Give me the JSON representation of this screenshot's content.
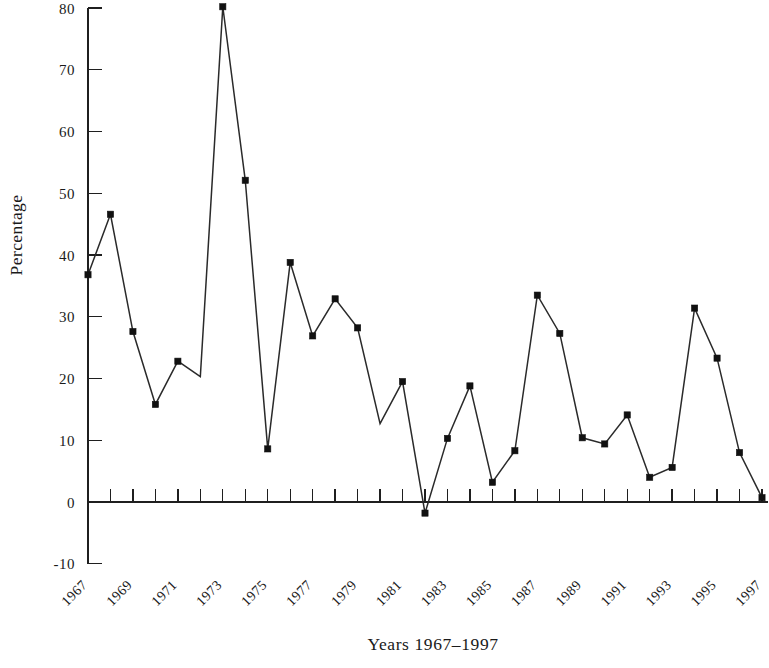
{
  "chart_data": {
    "type": "line",
    "title": "",
    "subtitle": "",
    "xlabel": "Years 1967–1997",
    "ylabel": "Percentage",
    "grid": false,
    "legend": "none",
    "xlim": [
      1967,
      1997
    ],
    "ylim": [
      -10,
      80
    ],
    "ytick_values": [
      80,
      70,
      60,
      50,
      40,
      30,
      20,
      10,
      0,
      -10
    ],
    "ytick_labels": [
      "80",
      "70",
      "60",
      "50",
      "40",
      "30",
      "20",
      "10",
      "0",
      "-10"
    ],
    "xtick_values": [
      1967,
      1969,
      1971,
      1973,
      1975,
      1977,
      1979,
      1981,
      1983,
      1985,
      1987,
      1989,
      1991,
      1993,
      1995,
      1997
    ],
    "xtick_labels": [
      "1967",
      "1969",
      "1971",
      "1973",
      "1975",
      "1977",
      "1979",
      "1981",
      "1983",
      "1985",
      "1987",
      "1989",
      "1991",
      "1993",
      "1995",
      "1997"
    ],
    "xtick_rotation_deg": 45,
    "x": [
      1967,
      1968,
      1969,
      1970,
      1971,
      1972,
      1973,
      1974,
      1975,
      1976,
      1977,
      1978,
      1979,
      1980,
      1981,
      1982,
      1983,
      1984,
      1985,
      1986,
      1987,
      1988,
      1989,
      1990,
      1991,
      1992,
      1993,
      1994,
      1995,
      1996,
      1997
    ],
    "values": [
      36.8,
      46.6,
      27.6,
      15.8,
      22.8,
      20.3,
      80.2,
      52.1,
      8.6,
      38.8,
      26.9,
      32.9,
      28.2,
      12.7,
      19.5,
      -1.8,
      10.3,
      18.8,
      3.2,
      8.3,
      33.5,
      27.3,
      10.4,
      9.4,
      14.1,
      4.0,
      5.6,
      31.4,
      23.3,
      8.0,
      0.7
    ],
    "markers": [
      true,
      true,
      true,
      true,
      true,
      false,
      true,
      true,
      true,
      true,
      true,
      true,
      true,
      false,
      true,
      true,
      true,
      true,
      true,
      true,
      true,
      true,
      true,
      true,
      true,
      true,
      true,
      true,
      true,
      true,
      true
    ],
    "marker_shape": "square",
    "line_color": "#2a2a2a",
    "marker_color": "#111111",
    "axis_color": "#1f1f1f",
    "background_color": "#ffffff"
  }
}
